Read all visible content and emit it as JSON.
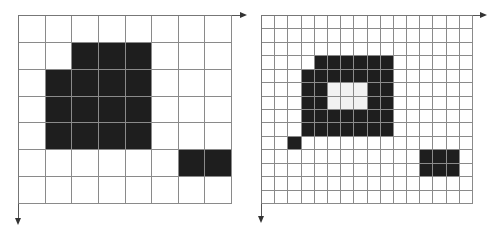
{
  "figure": {
    "panels": [
      {
        "name": "coarse-grid",
        "cols": 8,
        "rows": 7,
        "origin": [
          18,
          15
        ],
        "size": [
          214,
          189
        ],
        "axis_x_end": 247,
        "axis_y_end": 225,
        "filled": [
          [
            1,
            2
          ],
          [
            1,
            3
          ],
          [
            1,
            4
          ],
          [
            2,
            1
          ],
          [
            2,
            2
          ],
          [
            2,
            3
          ],
          [
            2,
            4
          ],
          [
            3,
            1
          ],
          [
            3,
            2
          ],
          [
            3,
            3
          ],
          [
            3,
            4
          ],
          [
            4,
            1
          ],
          [
            4,
            2
          ],
          [
            4,
            3
          ],
          [
            4,
            4
          ],
          [
            5,
            6
          ],
          [
            5,
            7
          ]
        ],
        "holes": []
      },
      {
        "name": "fine-grid",
        "cols": 16,
        "rows": 14,
        "origin": [
          261,
          15
        ],
        "size": [
          212,
          189
        ],
        "axis_x_end": 487,
        "axis_y_end": 223,
        "filled": [
          [
            3,
            4
          ],
          [
            3,
            5
          ],
          [
            3,
            6
          ],
          [
            3,
            7
          ],
          [
            3,
            8
          ],
          [
            3,
            9
          ],
          [
            4,
            3
          ],
          [
            4,
            4
          ],
          [
            4,
            5
          ],
          [
            4,
            6
          ],
          [
            4,
            7
          ],
          [
            4,
            8
          ],
          [
            4,
            9
          ],
          [
            5,
            3
          ],
          [
            5,
            4
          ],
          [
            5,
            8
          ],
          [
            5,
            9
          ],
          [
            6,
            3
          ],
          [
            6,
            4
          ],
          [
            6,
            8
          ],
          [
            6,
            9
          ],
          [
            7,
            3
          ],
          [
            7,
            4
          ],
          [
            7,
            5
          ],
          [
            7,
            6
          ],
          [
            7,
            7
          ],
          [
            7,
            8
          ],
          [
            7,
            9
          ],
          [
            8,
            3
          ],
          [
            8,
            4
          ],
          [
            8,
            5
          ],
          [
            8,
            6
          ],
          [
            8,
            7
          ],
          [
            8,
            8
          ],
          [
            8,
            9
          ],
          [
            9,
            2
          ],
          [
            10,
            12
          ],
          [
            10,
            13
          ],
          [
            10,
            14
          ],
          [
            11,
            12
          ],
          [
            11,
            13
          ],
          [
            11,
            14
          ]
        ],
        "holes": [
          [
            5,
            5
          ],
          [
            5,
            6
          ],
          [
            5,
            7
          ],
          [
            6,
            5
          ],
          [
            6,
            6
          ],
          [
            6,
            7
          ]
        ]
      }
    ],
    "colors": {
      "fill": "#1e1e1e",
      "hole": "#f2f2f2",
      "grid_line": "#8a8a8a",
      "axis": "#555555"
    }
  }
}
